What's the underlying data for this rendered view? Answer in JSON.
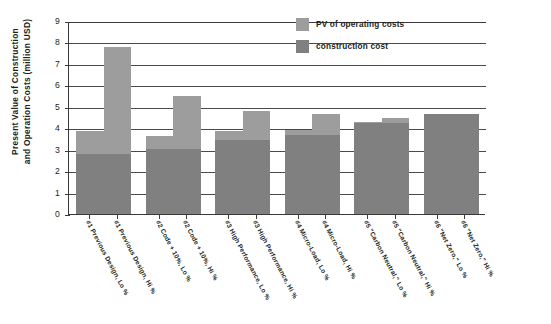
{
  "chart_data": {
    "type": "bar",
    "subtype": "stacked-bar",
    "title": "",
    "xlabel": "",
    "ylabel": "Present Value of Construction\nand Operation Costs (million USD)",
    "ylim": [
      0,
      9
    ],
    "yticks": [
      "9",
      "8",
      "7",
      "6",
      "5",
      "4",
      "3",
      "2",
      "1",
      "0"
    ],
    "grid": true,
    "legend_position": "top-right",
    "categories": [
      "#1 Previous Design, Lo %",
      "#1 Previous Design, Hi %",
      "#2 Code + 10%, Lo %",
      "#2 Code + 10%, Hi %",
      "#3 High Performance, Lo %",
      "#3 High Performance, Hi %",
      "#4 Micro-Load, Lo %",
      "#4 Micro-Load, Hi %",
      "#5 \"Carbon Neutral,\" Lo %",
      "#5 \"Carbon Neutral,\" Hi %",
      "#6 \"Net Zero,\" Lo %",
      "#6 \"Net Zero,\" Hi %"
    ],
    "series": [
      {
        "name": "construction cost",
        "color": "#808080",
        "values": [
          2.8,
          2.8,
          3.05,
          3.05,
          3.45,
          3.45,
          3.7,
          3.7,
          4.25,
          4.25,
          4.65,
          4.65
        ]
      },
      {
        "name": "PV of operating costs",
        "color": "#9d9d9d",
        "values": [
          1.05,
          5.0,
          0.6,
          2.45,
          0.4,
          1.35,
          0.2,
          0.95,
          0.05,
          0.25,
          0.0,
          0.0
        ]
      }
    ],
    "totals": [
      3.85,
      7.8,
      3.65,
      5.5,
      3.85,
      4.8,
      3.9,
      4.65,
      4.3,
      4.5,
      4.65,
      4.65
    ]
  },
  "legend": {
    "items": [
      {
        "label": "PV of operating costs",
        "color": "#9d9d9d"
      },
      {
        "label": "construction cost",
        "color": "#808080"
      }
    ]
  }
}
